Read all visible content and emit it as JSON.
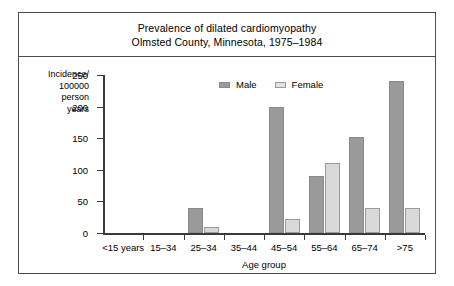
{
  "figure": {
    "title_lines": [
      "Prevalence of dilated cardiomyopathy",
      "Olmsted County, Minnesota, 1975–1984"
    ],
    "y_axis_title_lines": [
      "Incidence/",
      "100000",
      "person",
      "years"
    ],
    "x_axis_title": "Age group",
    "legend": [
      {
        "label": "Male",
        "color": "#9a9a9a"
      },
      {
        "label": "Female",
        "color": "#e2e2e2"
      }
    ]
  },
  "chart_data": {
    "type": "bar",
    "title": "Prevalence of dilated cardiomyopathy\nOlmsted County, Minnesota, 1975–1984",
    "xlabel": "Age group",
    "ylabel": "Incidence/100000 person years",
    "categories": [
      "<15 years",
      "15–34",
      "25–34",
      "35–44",
      "45–54",
      "55–64",
      "65–74",
      ">75"
    ],
    "series": [
      {
        "name": "Male",
        "color": "#9a9a9a",
        "values": [
          0,
          0,
          40,
          0,
          200,
          90,
          152,
          240
        ]
      },
      {
        "name": "Female",
        "color": "#e2e2e2",
        "values": [
          0,
          0,
          10,
          0,
          22,
          110,
          40,
          40
        ]
      }
    ],
    "ylim": [
      0,
      250
    ],
    "yticks": [
      0,
      50,
      100,
      150,
      200,
      250
    ],
    "ytick_labels": [
      "0",
      "50",
      "100",
      "150",
      "200",
      "250"
    ],
    "grid": false,
    "legend_position": "top-center"
  }
}
